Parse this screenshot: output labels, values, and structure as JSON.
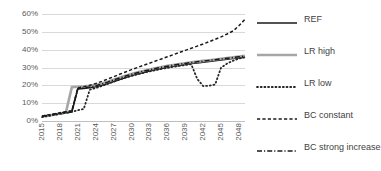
{
  "chart_data": {
    "type": "line",
    "title": "",
    "xlabel": "",
    "ylabel": "",
    "xlim": [
      2015,
      2049
    ],
    "ylim": [
      0,
      0.6
    ],
    "ytick_labels": [
      "60%",
      "50%",
      "40%",
      "30%",
      "20%",
      "10%",
      "0%"
    ],
    "ytick_values": [
      0.6,
      0.5,
      0.4,
      0.3,
      0.2,
      0.1,
      0.0
    ],
    "xtick_labels": [
      "2015",
      "2018",
      "2021",
      "2024",
      "2027",
      "2030",
      "2033",
      "2036",
      "2039",
      "2042",
      "2045",
      "2048"
    ],
    "xtick_values": [
      2015,
      2018,
      2021,
      2024,
      2027,
      2030,
      2033,
      2036,
      2039,
      2042,
      2045,
      2048
    ],
    "grid": true,
    "legend_position": "right",
    "x": [
      2015,
      2016,
      2017,
      2018,
      2019,
      2020,
      2021,
      2022,
      2023,
      2024,
      2025,
      2026,
      2027,
      2028,
      2029,
      2030,
      2031,
      2032,
      2033,
      2034,
      2035,
      2036,
      2037,
      2038,
      2039,
      2040,
      2041,
      2042,
      2043,
      2044,
      2045,
      2046,
      2047,
      2048,
      2049
    ],
    "series": [
      {
        "name": "REF",
        "style": "solid",
        "color": "#1a1a1a",
        "width": 1.6,
        "values": [
          0.025,
          0.03,
          0.035,
          0.04,
          0.045,
          0.05,
          0.18,
          0.183,
          0.187,
          0.192,
          0.2,
          0.21,
          0.222,
          0.233,
          0.244,
          0.255,
          0.264,
          0.272,
          0.28,
          0.288,
          0.295,
          0.301,
          0.307,
          0.312,
          0.317,
          0.322,
          0.326,
          0.33,
          0.334,
          0.338,
          0.342,
          0.346,
          0.35,
          0.354,
          0.358
        ]
      },
      {
        "name": "LR high",
        "style": "solid",
        "color": "#a6a6a6",
        "width": 2.6,
        "values": [
          0.025,
          0.03,
          0.035,
          0.042,
          0.048,
          0.19,
          0.192,
          0.194,
          0.197,
          0.202,
          0.21,
          0.22,
          0.232,
          0.243,
          0.254,
          0.264,
          0.273,
          0.281,
          0.289,
          0.296,
          0.303,
          0.309,
          0.314,
          0.319,
          0.324,
          0.329,
          0.333,
          0.337,
          0.341,
          0.345,
          0.349,
          0.353,
          0.357,
          0.362,
          0.366
        ]
      },
      {
        "name": "LR low",
        "style": "dotted",
        "color": "#262626",
        "width": 1.8,
        "values": [
          0.022,
          0.028,
          0.034,
          0.04,
          0.046,
          0.052,
          0.06,
          0.068,
          0.175,
          0.185,
          0.196,
          0.208,
          0.22,
          0.232,
          0.243,
          0.253,
          0.262,
          0.27,
          0.278,
          0.285,
          0.292,
          0.298,
          0.304,
          0.309,
          0.314,
          0.318,
          0.236,
          0.196,
          0.198,
          0.205,
          0.3,
          0.322,
          0.338,
          0.35,
          0.358
        ]
      },
      {
        "name": "BC constant",
        "style": "dashed",
        "color": "#1a1a1a",
        "width": 1.5,
        "values": [
          0.028,
          0.034,
          0.04,
          0.046,
          0.052,
          0.058,
          0.185,
          0.192,
          0.2,
          0.21,
          0.222,
          0.235,
          0.248,
          0.262,
          0.275,
          0.288,
          0.3,
          0.312,
          0.324,
          0.336,
          0.348,
          0.36,
          0.372,
          0.384,
          0.396,
          0.408,
          0.42,
          0.432,
          0.445,
          0.458,
          0.472,
          0.488,
          0.505,
          0.535,
          0.57
        ]
      },
      {
        "name": "BC strong increase",
        "style": "dashdot",
        "color": "#1a1a1a",
        "width": 1.5,
        "values": [
          0.026,
          0.032,
          0.038,
          0.044,
          0.05,
          0.056,
          0.182,
          0.186,
          0.191,
          0.198,
          0.207,
          0.218,
          0.23,
          0.241,
          0.252,
          0.262,
          0.271,
          0.279,
          0.287,
          0.294,
          0.301,
          0.307,
          0.313,
          0.318,
          0.323,
          0.328,
          0.332,
          0.336,
          0.34,
          0.344,
          0.348,
          0.352,
          0.356,
          0.36,
          0.364
        ]
      }
    ]
  },
  "legend": {
    "items": [
      {
        "label": "REF"
      },
      {
        "label": "LR high"
      },
      {
        "label": "LR low"
      },
      {
        "label": "BC constant"
      },
      {
        "label": "BC strong increase"
      }
    ]
  },
  "colors": {
    "background": "#ffffff",
    "gridline": "#d9d9d9",
    "axis": "#bfbfbf",
    "tick_text": "#595959",
    "legend_text": "#3f3f3f"
  }
}
